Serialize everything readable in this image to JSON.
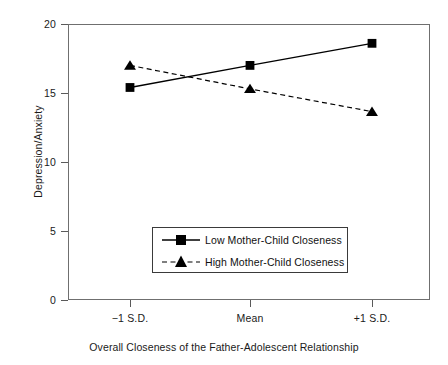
{
  "chart_data": {
    "type": "line",
    "title": "",
    "xlabel": "Overall Closeness of the Father-Adolescent Relationship",
    "ylabel": "Depression/Anxiety",
    "categories": [
      "−1 S.D.",
      "Mean",
      "+1 S.D."
    ],
    "ylim": [
      0,
      20
    ],
    "yticks": [
      0,
      5,
      10,
      15,
      20
    ],
    "ytick_labels": [
      "0",
      "5",
      "10",
      "15",
      "20"
    ],
    "grid": false,
    "legend_position": "inside-bottom-center",
    "series": [
      {
        "name": "Low Mother-Child Closeness",
        "values": [
          15.4,
          17.0,
          18.6
        ],
        "marker": "square",
        "line_style": "solid",
        "color": "#000000"
      },
      {
        "name": "High Mother-Child Closeness",
        "values": [
          17.0,
          15.3,
          13.65
        ],
        "marker": "triangle",
        "line_style": "dashed",
        "color": "#000000"
      }
    ]
  },
  "axes": {
    "y_labels": [
      "20",
      "15",
      "10",
      "5",
      "0"
    ],
    "x_labels": [
      "−1 S.D.",
      "Mean",
      "+1 S.D."
    ],
    "y_title": "Depression/Anxiety",
    "x_title": "Overall Closeness of the Father-Adolescent Relationship"
  },
  "legend": {
    "items": [
      {
        "label": "Low Mother-Child Closeness"
      },
      {
        "label": "High Mother-Child Closeness"
      }
    ]
  },
  "colors": {
    "ink": "#000000",
    "frame": "#6f6f6f",
    "background": "#ffffff"
  }
}
